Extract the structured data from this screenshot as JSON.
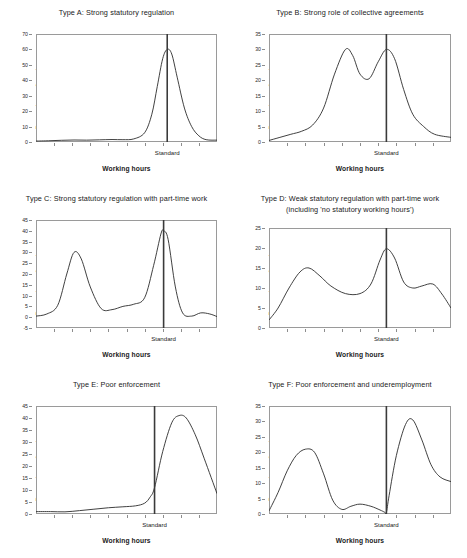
{
  "figure": {
    "axis_label_x": "Working hours",
    "axis_label_y": "Percentage of workers",
    "standard_label": "Standard",
    "line_color": "#2b2b2b",
    "frame_color": "#9a9a9a",
    "background": "#ffffff"
  },
  "chart_data": [
    {
      "id": "A",
      "type": "line",
      "title": "Type A: Strong statutory regulation",
      "xlabel": "Working hours",
      "ylabel": "Percentage of workers",
      "ylim": [
        0,
        70
      ],
      "yticks": [
        0,
        10,
        20,
        30,
        40,
        50,
        60,
        70
      ],
      "grid": false,
      "legend": "none",
      "annotations": [
        "Standard"
      ],
      "standard_x": 0.725,
      "x": [
        0.0,
        0.07,
        0.14,
        0.21,
        0.28,
        0.35,
        0.42,
        0.48,
        0.54,
        0.6,
        0.64,
        0.67,
        0.7,
        0.725,
        0.75,
        0.78,
        0.82,
        0.86,
        0.9,
        0.94,
        1.0
      ],
      "values": [
        0.6,
        0.8,
        1.1,
        1.3,
        1.2,
        1.4,
        1.6,
        1.5,
        2.0,
        6.0,
        18.0,
        36.0,
        54.0,
        60.0,
        57.0,
        42.0,
        22.0,
        10.0,
        4.0,
        1.5,
        1.2
      ]
    },
    {
      "id": "B",
      "type": "line",
      "title": "Type B: Strong role of collective agreements",
      "xlabel": "Working hours",
      "ylabel": "Percentage of workers",
      "ylim": [
        0,
        35
      ],
      "yticks": [
        0,
        5,
        10,
        15,
        20,
        25,
        30,
        35
      ],
      "grid": false,
      "legend": "none",
      "annotations": [
        "Standard"
      ],
      "standard_x": 0.645,
      "x": [
        0.0,
        0.06,
        0.12,
        0.18,
        0.24,
        0.3,
        0.36,
        0.42,
        0.46,
        0.5,
        0.55,
        0.6,
        0.645,
        0.69,
        0.74,
        0.79,
        0.85,
        0.91,
        1.0
      ],
      "values": [
        0.5,
        1.5,
        2.5,
        3.5,
        5.5,
        11.0,
        22.0,
        30.0,
        28.0,
        22.0,
        20.5,
        26.0,
        30.0,
        27.0,
        17.0,
        9.0,
        5.0,
        2.5,
        1.5
      ]
    },
    {
      "id": "C",
      "type": "line",
      "title": "Type C: Strong statutory regulation with part-time work",
      "xlabel": "Working hours",
      "ylabel": "Percentage of workers",
      "ylim": [
        -5,
        45
      ],
      "yticks": [
        -5,
        0,
        5,
        10,
        15,
        20,
        25,
        30,
        35,
        40,
        45
      ],
      "grid": false,
      "legend": "none",
      "annotations": [
        "Standard"
      ],
      "standard_x": 0.705,
      "x": [
        0.0,
        0.06,
        0.12,
        0.17,
        0.21,
        0.25,
        0.3,
        0.36,
        0.42,
        0.48,
        0.54,
        0.6,
        0.65,
        0.69,
        0.705,
        0.73,
        0.77,
        0.81,
        0.86,
        0.91,
        0.96,
        1.0
      ],
      "values": [
        0.5,
        1.5,
        5.5,
        20.0,
        30.0,
        27.0,
        14.0,
        4.0,
        3.5,
        5.0,
        6.0,
        9.0,
        24.0,
        38.5,
        40.0,
        36.0,
        14.0,
        2.0,
        0.5,
        2.0,
        1.5,
        0.3
      ]
    },
    {
      "id": "D",
      "type": "line",
      "title": "Type D: Weak statutory regulation with part-time work (including 'no statutory working hours')",
      "title_line1": "Type D: Weak statutory regulation with part-time work",
      "title_line2": "(including 'no statutory working hours')",
      "xlabel": "Working hours",
      "ylabel": "Percentage of workers",
      "ylim": [
        0,
        25
      ],
      "yticks": [
        0,
        5,
        10,
        15,
        20,
        25
      ],
      "grid": false,
      "legend": "none",
      "annotations": [
        "Standard"
      ],
      "standard_x": 0.645,
      "x": [
        0.0,
        0.05,
        0.11,
        0.17,
        0.22,
        0.28,
        0.34,
        0.42,
        0.5,
        0.56,
        0.61,
        0.645,
        0.69,
        0.74,
        0.79,
        0.84,
        0.9,
        0.95,
        1.0
      ],
      "values": [
        2.0,
        5.0,
        10.0,
        14.0,
        15.0,
        13.0,
        10.5,
        8.6,
        8.6,
        11.0,
        17.0,
        19.8,
        17.5,
        11.5,
        10.0,
        10.5,
        11.0,
        8.5,
        5.0
      ]
    },
    {
      "id": "E",
      "type": "line",
      "title": "Type E: Poor enforcement",
      "xlabel": "Working hours",
      "ylabel": "Percentage of workers",
      "ylim": [
        0,
        45
      ],
      "yticks": [
        0,
        5,
        10,
        15,
        20,
        25,
        30,
        35,
        40,
        45
      ],
      "grid": false,
      "legend": "none",
      "annotations": [
        "Standard"
      ],
      "standard_x": 0.655,
      "x": [
        0.0,
        0.08,
        0.16,
        0.24,
        0.32,
        0.4,
        0.48,
        0.55,
        0.6,
        0.63,
        0.655,
        0.7,
        0.75,
        0.79,
        0.83,
        0.88,
        0.93,
        1.0
      ],
      "values": [
        1.0,
        1.0,
        0.9,
        1.4,
        2.0,
        2.6,
        3.0,
        3.4,
        4.5,
        7.0,
        11.0,
        26.0,
        38.0,
        41.0,
        40.0,
        33.0,
        23.0,
        8.5
      ]
    },
    {
      "id": "F",
      "type": "line",
      "title": "Type F: Poor enforcement and underemployment",
      "xlabel": "Working hours",
      "ylabel": "Percentage of workers",
      "ylim": [
        0,
        35
      ],
      "yticks": [
        0,
        5,
        10,
        15,
        20,
        25,
        30,
        35
      ],
      "grid": false,
      "legend": "none",
      "annotations": [
        "Standard"
      ],
      "standard_x": 0.645,
      "x": [
        0.0,
        0.05,
        0.1,
        0.15,
        0.2,
        0.25,
        0.3,
        0.35,
        0.4,
        0.45,
        0.5,
        0.56,
        0.61,
        0.635,
        0.645,
        0.66,
        0.7,
        0.75,
        0.79,
        0.84,
        0.89,
        0.94,
        1.0
      ],
      "values": [
        1.0,
        7.0,
        14.0,
        19.0,
        21.0,
        20.0,
        13.0,
        4.5,
        1.5,
        2.5,
        3.2,
        2.5,
        1.3,
        0.6,
        0.5,
        6.0,
        19.0,
        29.0,
        30.5,
        24.0,
        16.0,
        12.0,
        10.5
      ]
    }
  ]
}
